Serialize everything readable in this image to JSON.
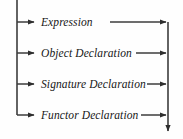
{
  "diagram": {
    "type": "railroad-flow-diagram",
    "colors": {
      "background": "#fefefe",
      "line": "#3a3a3a",
      "text": "#161616"
    },
    "geometry": {
      "width": 183,
      "height": 139,
      "left_rail_x": 17,
      "right_rail_x": 168,
      "rail_top_y": 0,
      "rail_bottom_y": 133,
      "row_ys": [
        22,
        53,
        84,
        115
      ]
    },
    "entry": {
      "name": "entry-line",
      "description": "vertical distributor line entering from top"
    },
    "exit": {
      "name": "exit-arrow",
      "description": "downward arrow leaving at bottom right"
    },
    "branches": [
      {
        "label": "Expression",
        "row": 0
      },
      {
        "label": "Object Declaration",
        "row": 1
      },
      {
        "label": "Signature Declaration",
        "row": 2
      },
      {
        "label": "Functor Declaration",
        "row": 3
      }
    ]
  }
}
